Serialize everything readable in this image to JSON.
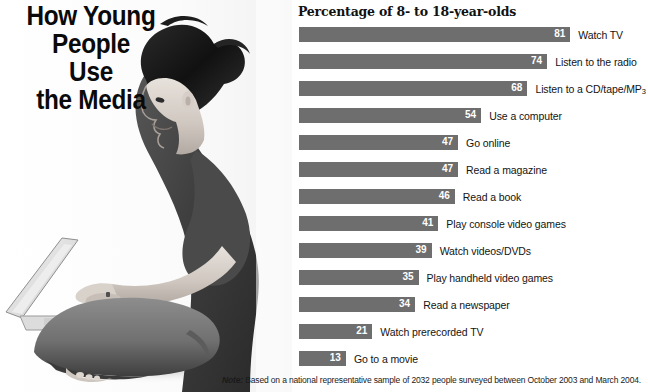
{
  "headline": {
    "lines": [
      "How Young",
      "People",
      "Use",
      "the Media"
    ]
  },
  "photo": {
    "alt": "Young woman sitting cross-legged on the floor using a laptop computer, black and white photograph"
  },
  "chart_data": {
    "type": "bar",
    "title": "Percentage of 8- to 18-year-olds",
    "xlabel": "",
    "ylabel": "",
    "xlim": [
      0,
      100
    ],
    "grid": false,
    "legend": "none",
    "orientation": "horizontal",
    "value_label_position": "inside-end",
    "bar_color": "#6e6e6e",
    "categories": [
      "Watch TV",
      "Listen to the radio",
      "Listen to a CD/tape/MP3",
      "Use a computer",
      "Go online",
      "Read a magazine",
      "Read a book",
      "Play console video games",
      "Watch videos/DVDs",
      "Play handheld video games",
      "Read a newspaper",
      "Watch prerecorded TV",
      "Go to a movie"
    ],
    "values": [
      81,
      74,
      68,
      54,
      47,
      47,
      46,
      41,
      39,
      35,
      34,
      21,
      13
    ],
    "annotations": [
      "Note: Based on a national representative sample of 2032 people surveyed between October 2003 and March 2004."
    ]
  },
  "footnote": {
    "label": "Note:",
    "text": " Based on a national representative sample of 2032 people surveyed between October 2003 and March 2004."
  }
}
